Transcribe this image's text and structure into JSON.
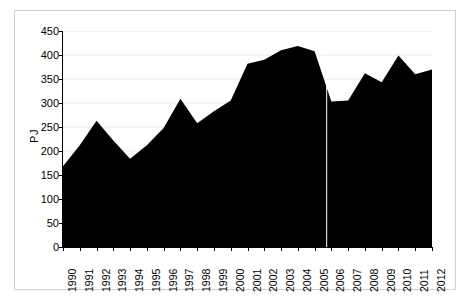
{
  "chart_data": {
    "type": "area",
    "title": "",
    "xlabel": "",
    "ylabel": "PJ",
    "categories": [
      "1990",
      "1991",
      "1992",
      "1993",
      "1994",
      "1995",
      "1996",
      "1997",
      "1998",
      "1999",
      "2000",
      "2001",
      "2002",
      "2003",
      "2004",
      "2005",
      "2006",
      "2007",
      "2008",
      "2009",
      "2010",
      "2011",
      "2012"
    ],
    "values": [
      168,
      212,
      263,
      222,
      184,
      212,
      248,
      309,
      258,
      283,
      305,
      382,
      390,
      410,
      419,
      408,
      303,
      305,
      362,
      343,
      399,
      360,
      370
    ],
    "series": [
      {
        "name": "PJ",
        "values": [
          168,
          212,
          263,
          222,
          184,
          212,
          248,
          309,
          258,
          283,
          305,
          382,
          390,
          410,
          419,
          408,
          303,
          305,
          362,
          343,
          399,
          360,
          370
        ]
      }
    ],
    "ylim": [
      0,
      450
    ],
    "yticks": [
      0,
      50,
      100,
      150,
      200,
      250,
      300,
      350,
      400,
      450
    ],
    "ytick_labels": [
      "0",
      "50",
      "100",
      "150",
      "200",
      "250",
      "300",
      "350",
      "400",
      "450"
    ],
    "xtick_labels": [
      "1990",
      "1991",
      "1992",
      "1993",
      "1994",
      "1995",
      "1996",
      "1997",
      "1998",
      "1999",
      "2000",
      "2001",
      "2002",
      "2003",
      "2004",
      "2005",
      "2006",
      "2007",
      "2008",
      "2009",
      "2010",
      "2011",
      "2012"
    ],
    "grid": true,
    "grid_axis": "y",
    "legend": false,
    "legend_position": "none",
    "fill_color": "#000000",
    "grid_color": "#e8e8e8",
    "axis_color": "#000000",
    "background_color": "#ffffff",
    "annotations": [
      {
        "name": "series-break-line",
        "type": "vline",
        "x_category": "2005",
        "x_offset_fraction": 0.72,
        "color": "#ffffff",
        "note": "thin vertical break line between 2005 and 2006"
      }
    ]
  },
  "axes": {
    "y_label": "PJ"
  }
}
